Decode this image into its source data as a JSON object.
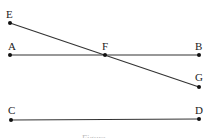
{
  "diagram": {
    "type": "geometry",
    "colors": {
      "line": "#333333",
      "point": "#111111",
      "label": "#222222",
      "caption": "#bbbbbb"
    },
    "points": {
      "E": {
        "label": "E",
        "x": 10,
        "y": 23
      },
      "A": {
        "label": "A",
        "x": 10,
        "y": 55
      },
      "F": {
        "label": "F",
        "x": 105,
        "y": 55
      },
      "B": {
        "label": "B",
        "x": 199,
        "y": 55
      },
      "G": {
        "label": "G",
        "x": 199,
        "y": 87
      },
      "C": {
        "label": "C",
        "x": 11,
        "y": 120
      },
      "D": {
        "label": "D",
        "x": 199,
        "y": 119
      }
    },
    "segments": [
      [
        "A",
        "B"
      ],
      [
        "E",
        "G"
      ],
      [
        "C",
        "D"
      ]
    ],
    "caption": "Figure"
  }
}
